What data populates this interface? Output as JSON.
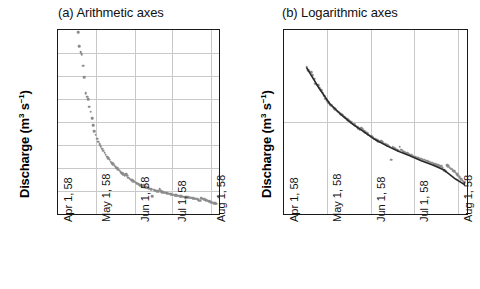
{
  "figure": {
    "panels": [
      {
        "id": "a",
        "title": "(a) Arithmetic axes",
        "ylabel": "Discharge (m3 s-1)",
        "ylabel_display": "Discharge (m³ s⁻¹)",
        "yscale": "linear",
        "yticks": [
          "0",
          "0.5",
          "1",
          "1.5",
          "2",
          "2.5",
          "3",
          "3.5",
          "4"
        ],
        "xticks": [
          "Apr 1, 58",
          "May 1, 58",
          "Jun 1, 58",
          "Jul 1, 58",
          "Aug 1, 58"
        ],
        "has_fit_line": false
      },
      {
        "id": "b",
        "title": "(b) Logarithmic axes",
        "ylabel": "Discharge (m3 s-1)",
        "ylabel_display": "Discharge (m³ s⁻¹)",
        "yscale": "log",
        "yticks": [
          "0.1",
          "1",
          "10"
        ],
        "xticks": [
          "Apr 1, 58",
          "May 1, 58",
          "Jun 1, 58",
          "Jul 1, 58",
          "Aug 1, 58"
        ],
        "has_fit_line": true
      }
    ]
  },
  "colors": {
    "marker": "#8c8c8c",
    "fit_line": "#2a2a2a",
    "axis": "#1a1a1a",
    "grid": "#c9c9c9",
    "background": "#ffffff"
  },
  "chart_data": {
    "type": "scatter",
    "xlabel": "",
    "ylabel": "Discharge (m³ s⁻¹)",
    "x_tick_labels": [
      "Apr 1, 58",
      "May 1, 58",
      "Jun 1, 58",
      "Jul 1, 58",
      "Aug 1, 58"
    ],
    "x_tick_days": [
      0,
      30,
      61,
      91,
      122
    ],
    "xlim_days": [
      0,
      128
    ],
    "grid": true,
    "legend": "none",
    "panels": [
      {
        "id": "a",
        "title": "(a) Arithmetic axes",
        "yscale": "linear",
        "ylim": [
          0,
          4
        ],
        "yticks": [
          0,
          0.5,
          1,
          1.5,
          2,
          2.5,
          3,
          3.5,
          4
        ]
      },
      {
        "id": "b",
        "title": "(b) Logarithmic axes",
        "yscale": "log",
        "ylim": [
          0.1,
          10
        ],
        "yticks": [
          0.1,
          1,
          10
        ]
      }
    ],
    "series": [
      {
        "name": "Discharge",
        "marker": "circle",
        "color": "#8c8c8c",
        "x_days": [
          16.0,
          17.0,
          18.0,
          19.0,
          20.0,
          21.0,
          22.0,
          23.0,
          24.0,
          25.0,
          26.0,
          27.0,
          28.0,
          29.0,
          30.0,
          31.0,
          32.0,
          33.0,
          34.0,
          35.0,
          36.0,
          37.0,
          38.0,
          39.0,
          40.0,
          41.0,
          42.0,
          43.0,
          44.0,
          45.0,
          46.0,
          47.0,
          48.0,
          49.0,
          50.0,
          51.0,
          52.0,
          53.0,
          54.0,
          55.0,
          56.0,
          57.0,
          58.0,
          59.0,
          60.0,
          61.0,
          62.0,
          63.0,
          64.0,
          65.0,
          66.0,
          67.0,
          68.0,
          69.0,
          70.0,
          71.0,
          72.0,
          73.0,
          74.0,
          75.0,
          76.0,
          77.0,
          78.0,
          79.0,
          80.0,
          81.0,
          82.0,
          83.0,
          84.0,
          85.0,
          86.0,
          87.0,
          88.0,
          89.0,
          90.0,
          91.0,
          92.0,
          93.0,
          94.0,
          95.0,
          96.0,
          97.0,
          98.0,
          99.0,
          100.0,
          101.0,
          102.0,
          103.0,
          104.0,
          105.0,
          106.0,
          107.0,
          108.0,
          109.0,
          110.0,
          111.0,
          112.0,
          113.0,
          114.0,
          115.0,
          116.0,
          117.0,
          118.0,
          119.0,
          120.0,
          121.0,
          122.0,
          123.0,
          124.0,
          125.0,
          126.0
        ],
        "y_values": [
          3.95,
          3.65,
          3.52,
          3.48,
          3.22,
          2.97,
          2.62,
          2.55,
          2.5,
          2.33,
          2.22,
          2.08,
          1.93,
          1.8,
          1.72,
          1.64,
          1.57,
          1.52,
          1.47,
          1.42,
          1.38,
          1.33,
          1.29,
          1.25,
          1.21,
          1.18,
          1.14,
          1.11,
          1.08,
          1.05,
          1.02,
          0.99,
          0.96,
          0.94,
          0.91,
          0.89,
          0.86,
          0.84,
          0.86,
          0.83,
          0.79,
          0.77,
          0.75,
          0.73,
          0.71,
          0.7,
          0.68,
          0.66,
          0.65,
          0.63,
          0.62,
          0.61,
          0.62,
          0.6,
          0.58,
          0.57,
          0.56,
          0.55,
          0.54,
          0.39,
          0.53,
          0.52,
          0.51,
          0.5,
          0.49,
          0.54,
          0.5,
          0.48,
          0.47,
          0.46,
          0.46,
          0.45,
          0.44,
          0.44,
          0.43,
          0.42,
          0.42,
          0.41,
          0.41,
          0.4,
          0.4,
          0.39,
          0.39,
          0.38,
          0.38,
          0.37,
          0.37,
          0.36,
          0.36,
          0.35,
          0.35,
          0.34,
          0.34,
          0.33,
          0.33,
          0.32,
          0.3,
          0.29,
          0.34,
          0.33,
          0.32,
          0.31,
          0.3,
          0.29,
          0.28,
          0.27,
          0.26,
          0.25,
          0.24,
          0.23,
          0.22,
          0.21,
          0.21,
          0.2,
          0.2
        ]
      },
      {
        "name": "Fitted recession (panel b only)",
        "type": "line",
        "color": "#2a2a2a",
        "x_days": [
          16,
          24,
          32,
          40,
          48,
          56,
          64,
          72,
          80,
          88,
          96,
          104,
          112,
          120,
          126
        ],
        "y_values": [
          3.85,
          2.4,
          1.58,
          1.2,
          0.95,
          0.78,
          0.64,
          0.55,
          0.48,
          0.43,
          0.38,
          0.34,
          0.3,
          0.24,
          0.21
        ]
      }
    ]
  }
}
